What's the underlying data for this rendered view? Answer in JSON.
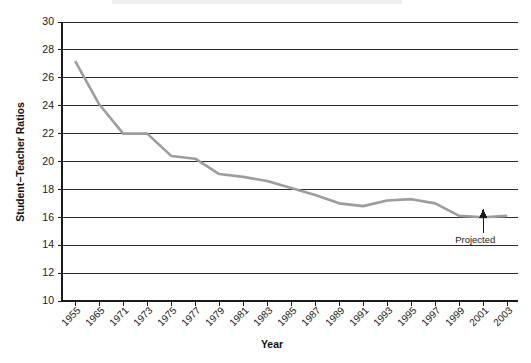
{
  "chart_data": {
    "type": "line",
    "title": "",
    "xlabel": "Year",
    "ylabel": "Student−Teacher Ratios",
    "ylim": [
      10,
      30
    ],
    "yticks": [
      10,
      12,
      14,
      16,
      18,
      20,
      22,
      24,
      26,
      28,
      30
    ],
    "grid": true,
    "legend": "none",
    "line_color": "#9d9d9d",
    "categories": [
      "1955",
      "1965",
      "1971",
      "1973",
      "1975",
      "1977",
      "1979",
      "1981",
      "1983",
      "1985",
      "1987",
      "1989",
      "1991",
      "1993",
      "1995",
      "1997",
      "1999",
      "2001",
      "2003"
    ],
    "values": [
      27.2,
      24.1,
      22.0,
      22.0,
      20.4,
      20.2,
      19.1,
      18.9,
      18.6,
      18.1,
      17.6,
      17.0,
      16.8,
      17.2,
      17.3,
      17.0,
      16.1,
      16.0,
      16.1
    ],
    "annotations": [
      {
        "text": "Projected",
        "marker": "up-arrow",
        "at_category": "2001",
        "at_value": 16.0
      }
    ]
  },
  "axis": {
    "x_title": "Year",
    "y_title": "Student−Teacher Ratios"
  },
  "annotation": {
    "projected_label": "Projected"
  }
}
